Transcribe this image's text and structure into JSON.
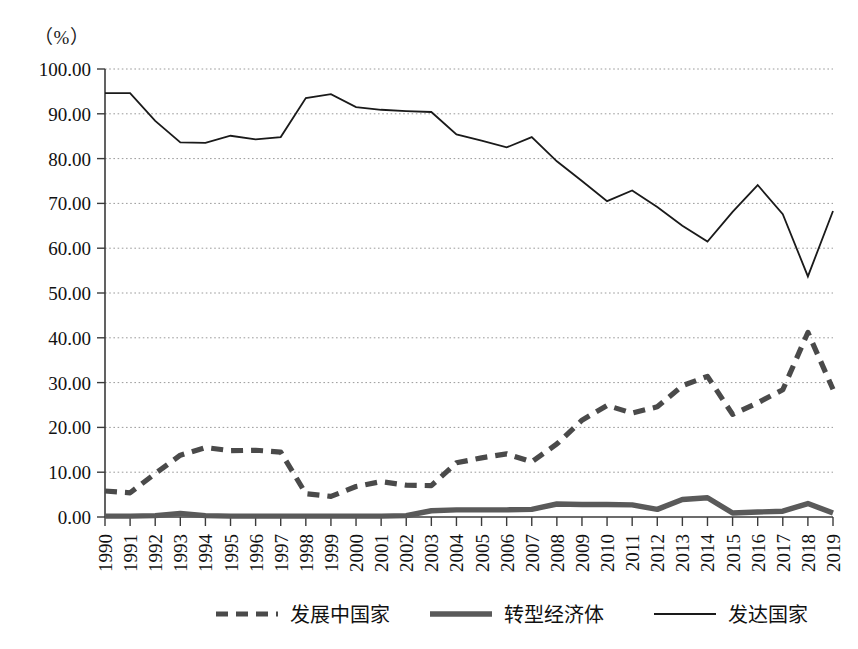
{
  "chart_data": {
    "type": "line",
    "title": "",
    "subtitle": "",
    "unit_label": "（%）",
    "xlabel": "",
    "ylabel": "",
    "ylim": [
      0,
      100
    ],
    "ytick_values": [
      0,
      10,
      20,
      30,
      40,
      50,
      60,
      70,
      80,
      90,
      100
    ],
    "ytick_labels": [
      "0.00",
      "10.00",
      "20.00",
      "30.00",
      "40.00",
      "50.00",
      "60.00",
      "70.00",
      "80.00",
      "90.00",
      "100.00"
    ],
    "grid": true,
    "grid_axis": "y",
    "legend_position": "bottom",
    "categories": [
      "1990",
      "1991",
      "1992",
      "1993",
      "1994",
      "1995",
      "1996",
      "1997",
      "1998",
      "1999",
      "2000",
      "2001",
      "2002",
      "2003",
      "2004",
      "2005",
      "2006",
      "2007",
      "2008",
      "2009",
      "2010",
      "2011",
      "2012",
      "2013",
      "2014",
      "2015",
      "2016",
      "2017",
      "2018",
      "2019"
    ],
    "series": [
      {
        "name": "发展中国家",
        "style": "dashed",
        "color": "#4a4a4a",
        "values": [
          5.8,
          5.4,
          9.7,
          13.8,
          15.5,
          14.8,
          14.9,
          14.5,
          5.2,
          4.6,
          6.8,
          7.9,
          7.1,
          7.0,
          12.1,
          13.2,
          14.1,
          12.3,
          16.3,
          21.6,
          24.9,
          23.2,
          24.6,
          29.3,
          31.4,
          22.9,
          25.5,
          28.4,
          41.2,
          28.5
        ]
      },
      {
        "name": "转型经济体",
        "style": "solid-thick",
        "color": "#5a5a5a",
        "values": [
          0.2,
          0.2,
          0.3,
          0.8,
          0.3,
          0.2,
          0.2,
          0.2,
          0.2,
          0.2,
          0.2,
          0.2,
          0.3,
          1.4,
          1.6,
          1.6,
          1.6,
          1.7,
          2.9,
          2.8,
          2.8,
          2.7,
          1.7,
          3.9,
          4.3,
          0.9,
          1.1,
          1.3,
          3.0,
          0.9
        ]
      },
      {
        "name": "发达国家",
        "style": "solid-thin",
        "color": "#1a1a1a",
        "values": [
          94.6,
          94.6,
          88.4,
          83.6,
          83.5,
          85.1,
          84.3,
          84.8,
          93.5,
          94.4,
          91.5,
          90.9,
          90.6,
          90.4,
          85.4,
          84.0,
          82.5,
          84.8,
          79.4,
          75.0,
          70.5,
          72.9,
          69.2,
          65.0,
          61.5,
          68.1,
          74.1,
          67.6,
          53.7,
          68.3
        ]
      }
    ]
  },
  "legend": {
    "items": [
      {
        "label": "发展中国家",
        "marker": "dashed-line"
      },
      {
        "label": "转型经济体",
        "marker": "thick-line"
      },
      {
        "label": "发达国家",
        "marker": "thin-line"
      }
    ]
  }
}
